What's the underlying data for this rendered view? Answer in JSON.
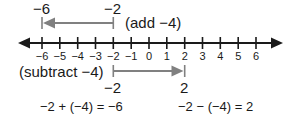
{
  "diagram": {
    "type": "number-line",
    "number_line": {
      "min": -6,
      "max": 6,
      "ticks": [
        -6,
        -5,
        -4,
        -3,
        -2,
        -1,
        0,
        1,
        2,
        3,
        4,
        5,
        6
      ],
      "tick_labels": [
        "−6",
        "−5",
        "−4",
        "−3",
        "−2",
        "−1",
        "0",
        "1",
        "2",
        "3",
        "4",
        "5",
        "6"
      ],
      "arrows_both_ends": true
    },
    "add_arrow": {
      "from": -2,
      "to": -6,
      "from_label": "−2",
      "to_label": "−6",
      "caption": "(add −4)",
      "color": "#808080"
    },
    "subtract_arrow": {
      "from": -2,
      "to": 2,
      "from_label": "−2",
      "to_label": "2",
      "caption": "(subtract −4)",
      "color": "#808080"
    },
    "equations": {
      "addition": "−2 + (−4) = −6",
      "subtraction": "−2 − (−4) = 2"
    },
    "colors": {
      "axis": "#1a1a1a",
      "arrow": "#808080",
      "background": "#ffffff"
    }
  }
}
